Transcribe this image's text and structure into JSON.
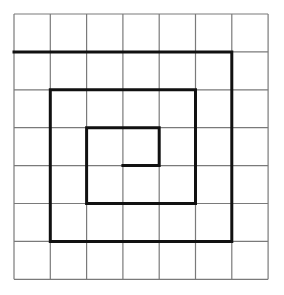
{
  "diagram": {
    "type": "grid-spiral",
    "grid": {
      "columns": 7,
      "rows": 7,
      "origin": [
        14,
        14
      ],
      "cell_width": 36.3,
      "cell_height": 37.9,
      "line_color": "#7a7a7a",
      "line_width": 1.2
    },
    "spiral": {
      "color": "#111111",
      "line_width": 3,
      "points_grid": [
        [
          0,
          1
        ],
        [
          6,
          1
        ],
        [
          6,
          6
        ],
        [
          1,
          6
        ],
        [
          1,
          2
        ],
        [
          5,
          2
        ],
        [
          5,
          5
        ],
        [
          2,
          5
        ],
        [
          2,
          3
        ],
        [
          4,
          3
        ],
        [
          4,
          4
        ],
        [
          3,
          4
        ]
      ]
    },
    "background": "#ffffff"
  }
}
